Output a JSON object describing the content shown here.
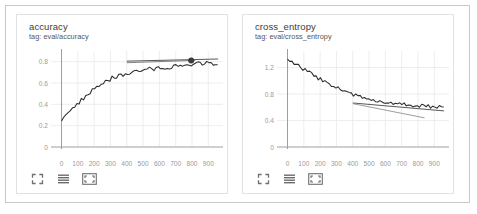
{
  "page": {
    "app": "TensorBoard Scalars"
  },
  "cards": [
    {
      "id": "accuracy",
      "title": "accuracy",
      "tag": "tag: eval/accuracy",
      "toolbar": [
        {
          "name": "expand-corners-icon",
          "label": "fit-domain-to-data"
        },
        {
          "name": "chart-lines-icon",
          "label": "toggle-y-axis-log-scale"
        },
        {
          "name": "fullscreen-box-icon",
          "label": "toggle-fullscreen"
        }
      ]
    },
    {
      "id": "cross_entropy",
      "title": "cross_entropy",
      "tag": "tag: eval/cross_entropy",
      "toolbar": [
        {
          "name": "expand-corners-icon",
          "label": "fit-domain-to-data"
        },
        {
          "name": "chart-lines-icon",
          "label": "toggle-y-axis-log-scale"
        },
        {
          "name": "fullscreen-box-icon",
          "label": "toggle-fullscreen"
        }
      ]
    }
  ],
  "chart_data": [
    {
      "type": "line",
      "id": "accuracy",
      "title": "accuracy",
      "subtitle": "tag: eval/accuracy",
      "xlabel": "",
      "ylabel": "",
      "grid": true,
      "legend": "none",
      "xlim": [
        -40,
        990
      ],
      "ylim": [
        0,
        0.9
      ],
      "xticks": [
        0,
        100,
        200,
        300,
        400,
        500,
        600,
        700,
        800,
        900
      ],
      "xtick_labels": [
        "0",
        "100",
        "200",
        "300",
        "400",
        "500",
        "600",
        "700",
        "800",
        "900"
      ],
      "yticks": [
        0,
        0.2,
        0.4,
        0.6,
        0.8
      ],
      "ytick_labels": [
        "0",
        "0.2",
        "0.4",
        "0.6",
        "0.8"
      ],
      "series": [
        {
          "name": "eval/accuracy",
          "color": "#2b2b2b",
          "style": "noisy-line",
          "x": [
            0,
            20,
            40,
            60,
            80,
            100,
            120,
            140,
            160,
            180,
            200,
            220,
            240,
            260,
            280,
            300,
            320,
            340,
            360,
            380,
            400,
            420,
            440,
            460,
            480,
            500,
            520,
            540,
            560,
            580,
            600,
            620,
            640,
            660,
            680,
            700,
            720,
            740,
            760,
            780,
            800,
            820,
            840,
            860,
            880,
            900,
            920,
            940,
            960
          ],
          "values": [
            0.255,
            0.3,
            0.335,
            0.345,
            0.375,
            0.41,
            0.435,
            0.465,
            0.49,
            0.515,
            0.545,
            0.565,
            0.585,
            0.6,
            0.615,
            0.635,
            0.645,
            0.655,
            0.665,
            0.675,
            0.685,
            0.695,
            0.7,
            0.705,
            0.715,
            0.72,
            0.725,
            0.73,
            0.735,
            0.74,
            0.745,
            0.745,
            0.75,
            0.75,
            0.755,
            0.755,
            0.76,
            0.765,
            0.765,
            0.77,
            0.775,
            0.775,
            0.78,
            0.775,
            0.78,
            0.785,
            0.78,
            0.775,
            0.775
          ],
          "noise": 0.026
        },
        {
          "name": "trend-line",
          "color": "#3a3a3a",
          "style": "thin-line",
          "x": [
            400,
            960
          ],
          "values": [
            0.805,
            0.825
          ]
        },
        {
          "name": "reference-line",
          "color": "#6e6e6e",
          "style": "thin-line",
          "x": [
            400,
            820
          ],
          "values": [
            0.79,
            0.812
          ]
        }
      ],
      "markers": [
        {
          "name": "data-point-marker",
          "x": 795,
          "y": 0.812,
          "color": "#3a3a3a",
          "radius": 3
        }
      ]
    },
    {
      "type": "line",
      "id": "cross_entropy",
      "title": "cross_entropy",
      "subtitle": "tag: eval/cross_entropy",
      "xlabel": "",
      "ylabel": "",
      "grid": true,
      "legend": "none",
      "xlim": [
        -40,
        990
      ],
      "ylim": [
        0,
        1.45
      ],
      "xticks": [
        0,
        100,
        200,
        300,
        400,
        500,
        600,
        700,
        800,
        900
      ],
      "xtick_labels": [
        "0",
        "100",
        "200",
        "300",
        "400",
        "500",
        "600",
        "700",
        "800",
        "900"
      ],
      "yticks": [
        0,
        0.4,
        0.8,
        1.2
      ],
      "ytick_labels": [
        "0",
        "0.4",
        "0.8",
        "1.2"
      ],
      "series": [
        {
          "name": "eval/cross_entropy",
          "color": "#2b2b2b",
          "style": "noisy-line",
          "x": [
            0,
            20,
            40,
            60,
            80,
            100,
            120,
            140,
            160,
            180,
            200,
            220,
            240,
            260,
            280,
            300,
            320,
            340,
            360,
            380,
            400,
            420,
            440,
            460,
            480,
            500,
            520,
            540,
            560,
            580,
            600,
            620,
            640,
            660,
            680,
            700,
            720,
            740,
            760,
            780,
            800,
            820,
            840,
            860,
            880,
            900,
            920,
            940,
            960
          ],
          "values": [
            1.305,
            1.285,
            1.26,
            1.235,
            1.205,
            1.175,
            1.15,
            1.12,
            1.09,
            1.06,
            1.03,
            1.0,
            0.975,
            0.95,
            0.925,
            0.9,
            0.875,
            0.855,
            0.835,
            0.815,
            0.79,
            0.775,
            0.76,
            0.745,
            0.735,
            0.725,
            0.715,
            0.705,
            0.695,
            0.685,
            0.675,
            0.67,
            0.665,
            0.66,
            0.655,
            0.65,
            0.645,
            0.64,
            0.635,
            0.63,
            0.625,
            0.625,
            0.62,
            0.615,
            0.615,
            0.61,
            0.61,
            0.605,
            0.605
          ],
          "noise": 0.035
        },
        {
          "name": "trend-line",
          "color": "#3a3a3a",
          "style": "thin-line",
          "x": [
            400,
            960
          ],
          "values": [
            0.665,
            0.545
          ]
        },
        {
          "name": "reference-line",
          "color": "#8a8a8a",
          "style": "thin-line",
          "x": [
            400,
            840
          ],
          "values": [
            0.655,
            0.44
          ]
        }
      ],
      "markers": []
    }
  ]
}
